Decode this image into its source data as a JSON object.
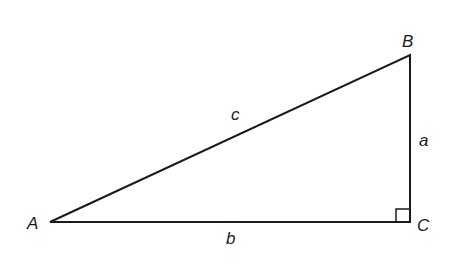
{
  "diagram": {
    "vertices": {
      "A": {
        "label": "A",
        "x": 50,
        "y": 222
      },
      "B": {
        "label": "B",
        "x": 410,
        "y": 55
      },
      "C": {
        "label": "C",
        "x": 410,
        "y": 222
      }
    },
    "sides": {
      "c": {
        "label": "c",
        "from": "A",
        "to": "B"
      },
      "a": {
        "label": "a",
        "from": "B",
        "to": "C"
      },
      "b": {
        "label": "b",
        "from": "A",
        "to": "C"
      }
    },
    "right_angle_at": "C",
    "stroke_color": "#1a1a1a"
  }
}
